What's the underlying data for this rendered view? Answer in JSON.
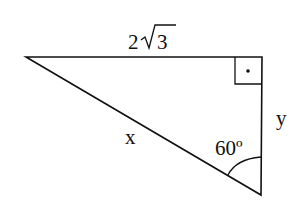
{
  "diagram": {
    "type": "right-triangle",
    "labels": {
      "top_side": "2√3",
      "top_side_coef": "2",
      "top_side_radicand": "3",
      "hypotenuse": "x",
      "right_side": "y",
      "angle": "60º"
    },
    "right_angle_marker": "square-with-dot",
    "colors": {
      "stroke": "#111111",
      "background": "#ffffff"
    }
  }
}
